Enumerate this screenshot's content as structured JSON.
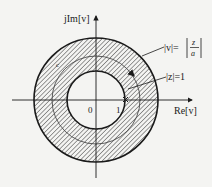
{
  "diagram": {
    "type": "complex-plane contour diagram",
    "axes": {
      "y_label": "jIm[v]",
      "x_label": "Re[v]",
      "origin_label": "0",
      "unit_label": "1"
    },
    "annotations": {
      "outer_circle": "|v| = |z/a|",
      "outer_circle_lhs": "|v|=",
      "outer_circle_num": "z",
      "outer_circle_den": "a",
      "inner_marker": "|z|=1",
      "contour_label": "c"
    },
    "regions": {
      "annulus": "hatched region between inner and outer circles"
    },
    "colors": {
      "background": "#f4f4f2",
      "ink": "#1a1a1a",
      "hatch": "#3a3a3a"
    }
  }
}
